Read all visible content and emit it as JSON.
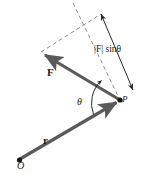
{
  "figure": {
    "background_color": "#ffffff",
    "vector_color": "#5a5a5a",
    "line_color": "#1a1a1a",
    "dash_color": "#8a8a8a",
    "labels": {
      "force_vector": "F",
      "position_vector": "r",
      "origin_point": "O",
      "application_point": "P",
      "angle": "θ",
      "projection": "|F| sinθ"
    },
    "points": {
      "origin": {
        "name": "O",
        "x": 19,
        "y": 160
      },
      "application": {
        "name": "P",
        "x": 120,
        "y": 100
      }
    },
    "vectors": [
      {
        "name": "r",
        "from": "O",
        "to": "P",
        "label": "r",
        "style": "solid-arrow"
      },
      {
        "name": "F",
        "from": "P",
        "to": "tip",
        "tip_x": 41,
        "tip_y": 53,
        "label": "F",
        "style": "solid-arrow"
      }
    ],
    "construction_lines": [
      {
        "name": "r-extension-dashed",
        "x1": 73,
        "y1": 3,
        "x2": 120,
        "y2": 100,
        "style": "dashed"
      },
      {
        "name": "force-tip-dashed",
        "x1": 41,
        "y1": 52,
        "x2": 101,
        "y2": 14,
        "style": "dashed"
      }
    ],
    "dimension": {
      "name": "projection-measure",
      "x1": 101,
      "y1": 14,
      "x2": 133,
      "y2": 90,
      "arrowheads": "both",
      "label": "|F| sinθ"
    },
    "angle_arc": {
      "name": "theta-arc",
      "center_x": 120,
      "center_y": 100,
      "radius": 31,
      "label": "θ"
    }
  }
}
